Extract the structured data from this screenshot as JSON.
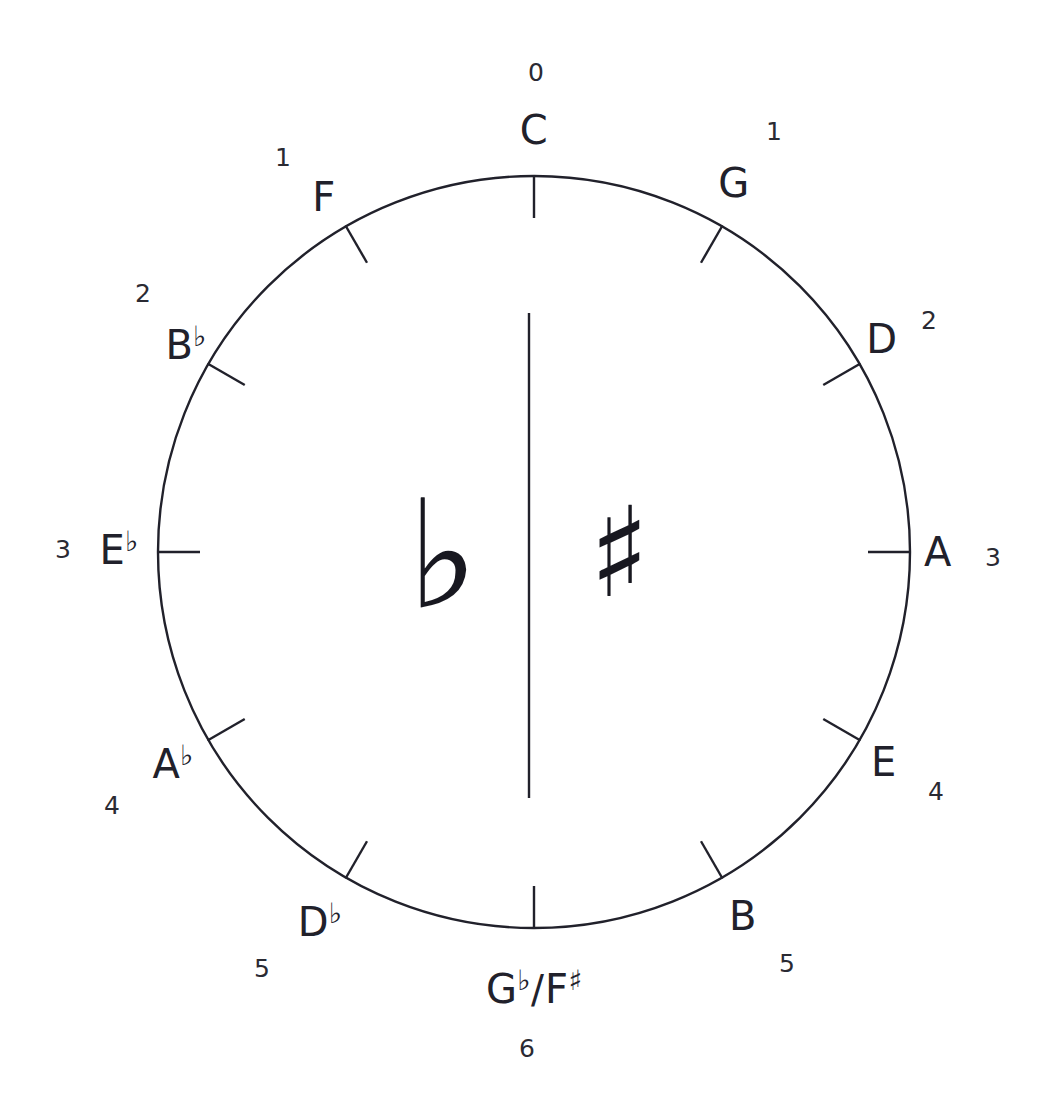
{
  "diagram": {
    "type": "circle-of-fifths",
    "stroke_color": "#21212b",
    "background_color": "#ffffff",
    "circle": {
      "center_x": 534,
      "center_y": 552,
      "radius": 376
    },
    "divider": {
      "x": 529,
      "y_top": 313,
      "y_bottom": 798
    },
    "center_symbols": {
      "flat": {
        "glyph": "♭",
        "side": "left",
        "x": 443,
        "y": 555
      },
      "sharp": {
        "glyph": "♯",
        "side": "right",
        "x": 619,
        "y": 552
      }
    },
    "positions": [
      {
        "key": "C",
        "root": "C",
        "accidental": "",
        "count": "0",
        "angle_deg": 0,
        "note_x": 534,
        "note_y": 130,
        "count_x": 536,
        "count_y": 72,
        "side": "center-top"
      },
      {
        "key": "G",
        "root": "G",
        "accidental": "",
        "count": "1",
        "angle_deg": 30,
        "note_x": 734,
        "note_y": 183,
        "count_x": 774,
        "count_y": 131,
        "side": "sharps"
      },
      {
        "key": "D",
        "root": "D",
        "accidental": "",
        "count": "2",
        "angle_deg": 60,
        "note_x": 882,
        "note_y": 339,
        "count_x": 929,
        "count_y": 320,
        "side": "sharps"
      },
      {
        "key": "A",
        "root": "A",
        "accidental": "",
        "count": "3",
        "angle_deg": 90,
        "note_x": 938,
        "note_y": 552,
        "count_x": 993,
        "count_y": 557,
        "side": "sharps"
      },
      {
        "key": "E",
        "root": "E",
        "accidental": "",
        "count": "4",
        "angle_deg": 120,
        "note_x": 884,
        "note_y": 762,
        "count_x": 936,
        "count_y": 791,
        "side": "sharps"
      },
      {
        "key": "B",
        "root": "B",
        "accidental": "",
        "count": "5",
        "angle_deg": 150,
        "note_x": 743,
        "note_y": 916,
        "count_x": 787,
        "count_y": 963,
        "side": "sharps"
      },
      {
        "key": "Gb/F#",
        "root": "G",
        "accidental": "♭",
        "count": "6",
        "angle_deg": 180,
        "note_x": 534,
        "note_y": 988,
        "count_x": 527,
        "count_y": 1048,
        "side": "center-bottom",
        "enharmonic_root": "F",
        "enharmonic_accidental": "♯",
        "separator": "/"
      },
      {
        "key": "Db",
        "root": "D",
        "accidental": "♭",
        "count": "5",
        "angle_deg": 210,
        "note_x": 320,
        "note_y": 921,
        "count_x": 262,
        "count_y": 968,
        "side": "flats"
      },
      {
        "key": "Ab",
        "root": "A",
        "accidental": "♭",
        "count": "4",
        "angle_deg": 240,
        "note_x": 173,
        "note_y": 763,
        "count_x": 112,
        "count_y": 805,
        "side": "flats"
      },
      {
        "key": "Eb",
        "root": "E",
        "accidental": "♭",
        "count": "3",
        "angle_deg": 270,
        "note_x": 119,
        "note_y": 549,
        "count_x": 63,
        "count_y": 549,
        "side": "flats"
      },
      {
        "key": "Bb",
        "root": "B",
        "accidental": "♭",
        "count": "2",
        "angle_deg": 300,
        "note_x": 186,
        "note_y": 344,
        "count_x": 143,
        "count_y": 293,
        "side": "flats"
      },
      {
        "key": "F",
        "root": "F",
        "accidental": "",
        "count": "1",
        "angle_deg": 330,
        "note_x": 324,
        "note_y": 197,
        "count_x": 283,
        "count_y": 157,
        "side": "flats"
      }
    ]
  }
}
